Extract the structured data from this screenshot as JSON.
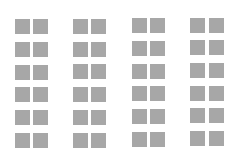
{
  "grid": {
    "fill_color": "#a7a7a7",
    "background_color": "#ffffff",
    "tile_size": 15,
    "row_pitch": 22.7,
    "columns_per_group": 2,
    "rows": 6,
    "groups": [
      {
        "name": "group-1",
        "x": [
          15,
          33
        ],
        "y0": 19.3
      },
      {
        "name": "group-2",
        "x": [
          73,
          91
        ],
        "y0": 19.0
      },
      {
        "name": "group-3",
        "x": [
          132,
          150
        ],
        "y0": 18.3
      },
      {
        "name": "group-4",
        "x": [
          190,
          209
        ],
        "y0": 17.5
      }
    ]
  }
}
